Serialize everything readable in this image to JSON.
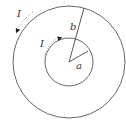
{
  "diagram": {
    "outer_circle": {
      "cx": 69,
      "cy": 62,
      "r": 56,
      "label": "b"
    },
    "inner_circle": {
      "cx": 69,
      "cy": 62,
      "r": 24,
      "label": "a"
    },
    "outer_current": {
      "label": "I",
      "direction": "counterclockwise"
    },
    "inner_current": {
      "label": "I",
      "direction": "clockwise"
    },
    "colors": {
      "stroke": "#555555",
      "text": "#333333",
      "background": "#ffffff"
    }
  }
}
